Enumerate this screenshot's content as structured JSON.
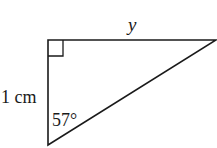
{
  "diagram": {
    "type": "right-triangle",
    "labels": {
      "top_side": "y",
      "left_side": "1 cm",
      "angle": "57°"
    },
    "right_angle_marker": true,
    "stroke_color": "#1a1a1a",
    "background": "#ffffff"
  }
}
